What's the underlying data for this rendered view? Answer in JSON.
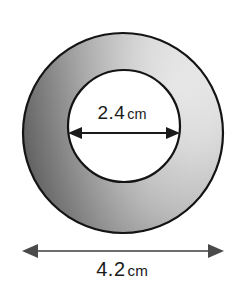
{
  "figure": {
    "type": "annulus-diagram",
    "background_color": "#ffffff",
    "outline_color": "#111111",
    "shading": {
      "dark_color": "#3a3a3a",
      "mid_color": "#8f8f8f",
      "light_color": "#d9d9d9",
      "inner_fill": "#ffffff"
    },
    "outer_circle": {
      "center_x": 123,
      "center_y": 133,
      "diameter_px": 200
    },
    "inner_circle": {
      "center_x": 124,
      "center_y": 126,
      "diameter_px": 112
    },
    "inner_dimension": {
      "value": "2.4",
      "unit": "cm",
      "arrow_color": "#1a1a1a",
      "arrow_y": 133,
      "arrow_x1": 68,
      "arrow_x2": 180
    },
    "outer_dimension": {
      "value": "4.2",
      "unit": "cm",
      "arrow_color": "#6e6e6e",
      "arrow_y": 251,
      "arrow_x1": 22,
      "arrow_x2": 224
    }
  }
}
